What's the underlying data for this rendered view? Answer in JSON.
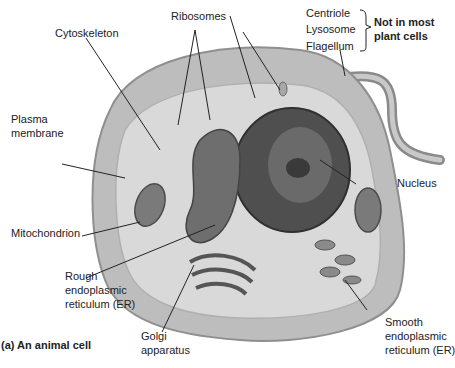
{
  "diagram": {
    "caption": "(a)  An animal cell",
    "labels": {
      "ribosomes": "Ribosomes",
      "cytoskeleton": "Cytoskeleton",
      "centriole": "Centriole",
      "lysosome": "Lysosome",
      "flagellum": "Flagellum",
      "not_in_plant_line1": "Not in most",
      "not_in_plant_line2": "plant cells",
      "plasma_membrane_line1": "Plasma",
      "plasma_membrane_line2": "membrane",
      "nucleus": "Nucleus",
      "mitochondrion": "Mitochondrion",
      "rough_er_line1": "Rough",
      "rough_er_line2": "endoplasmic",
      "rough_er_line3": "reticulum (ER)",
      "smooth_er_line1": "Smooth",
      "smooth_er_line2": "endoplasmic",
      "smooth_er_line3": "reticulum (ER)",
      "golgi_line1": "Golgi",
      "golgi_line2": "apparatus"
    },
    "colors": {
      "cytoplasm": "#c8c8c8",
      "membrane": "#a9a9a9",
      "nucleus": "#555555",
      "er": "#6e6e6e",
      "text": "#222222"
    }
  }
}
